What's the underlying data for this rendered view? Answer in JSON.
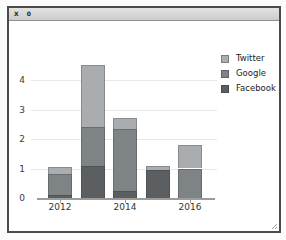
{
  "window": {
    "title": "X 0"
  },
  "chart_data": {
    "type": "bar",
    "stacked": true,
    "title": "",
    "xlabel": "",
    "ylabel": "",
    "categories": [
      "2012",
      "2013",
      "2014",
      "2015",
      "2016"
    ],
    "series": [
      {
        "name": "Facebook",
        "color": "#5b5f62",
        "values": [
          0.1,
          1.1,
          0.25,
          0.95,
          0
        ]
      },
      {
        "name": "Google",
        "color": "#7e8386",
        "values": [
          0.7,
          1.3,
          2.1,
          0,
          1.0
        ]
      },
      {
        "name": "Twitter",
        "color": "#a9adb0",
        "values": [
          0.25,
          2.1,
          0.35,
          0.15,
          0.8
        ]
      }
    ],
    "yticks": [
      0,
      1,
      2,
      3,
      4
    ],
    "ylim": [
      0,
      4.6
    ],
    "xticks": [
      {
        "label": "2012",
        "bar_index": 0
      },
      {
        "label": "2014",
        "bar_index": 2
      },
      {
        "label": "2016",
        "bar_index": 4
      }
    ],
    "legend": {
      "position": "upper right",
      "entries": [
        "Twitter",
        "Google",
        "Facebook"
      ]
    },
    "grid": true,
    "background": "#ffffff"
  }
}
